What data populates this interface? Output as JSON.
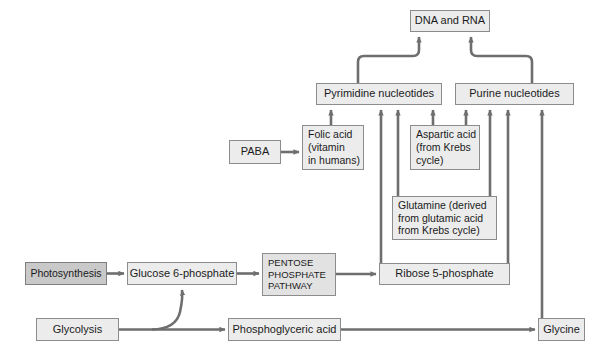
{
  "diagram": {
    "type": "flowchart",
    "colors": {
      "box_fill": "#ececec",
      "box_fill_highlight": "#c9c9c9",
      "box_border": "#8c8c8c",
      "arrow": "#6e6e6e",
      "text": "#1b1b1b",
      "background": "#ffffff"
    },
    "nodes": [
      {
        "id": "dna_rna",
        "label": "DNA and RNA",
        "x": 410,
        "y": 10,
        "w": 80,
        "h": 22,
        "style": "normal"
      },
      {
        "id": "pyrimidine",
        "label": "Pyrimidine nucleotides",
        "x": 316,
        "y": 83,
        "w": 126,
        "h": 22,
        "style": "normal"
      },
      {
        "id": "purine",
        "label": "Purine nucleotides",
        "x": 455,
        "y": 83,
        "w": 119,
        "h": 22,
        "style": "normal"
      },
      {
        "id": "paba",
        "label": "PABA",
        "x": 229,
        "y": 140,
        "w": 52,
        "h": 24,
        "style": "normal"
      },
      {
        "id": "folic_acid",
        "label": "Folic acid\n(vitamin\nin humans)",
        "x": 302,
        "y": 125,
        "w": 62,
        "h": 45,
        "style": "left"
      },
      {
        "id": "aspartic_acid",
        "label": "Aspartic acid\n(from Krebs\ncycle)",
        "x": 410,
        "y": 125,
        "w": 70,
        "h": 45,
        "style": "left"
      },
      {
        "id": "glutamine",
        "label": "Glutamine (derived\nfrom glutamic acid\nfrom Krebs cycle)",
        "x": 392,
        "y": 196,
        "w": 105,
        "h": 44,
        "style": "left"
      },
      {
        "id": "photosynthesis",
        "label": "Photosynthesis",
        "x": 25,
        "y": 262,
        "w": 82,
        "h": 23,
        "style": "dark"
      },
      {
        "id": "glucose6p",
        "label": "Glucose 6-phosphate",
        "x": 127,
        "y": 262,
        "w": 110,
        "h": 23,
        "style": "normal"
      },
      {
        "id": "ppp",
        "label": "PENTOSE\nPHOSPHATE\nPATHWAY",
        "x": 262,
        "y": 253,
        "w": 74,
        "h": 43,
        "style": "left"
      },
      {
        "id": "ribose5p",
        "label": "Ribose 5-phosphate",
        "x": 379,
        "y": 263,
        "w": 131,
        "h": 22,
        "style": "normal"
      },
      {
        "id": "glycolysis",
        "label": "Glycolysis",
        "x": 36,
        "y": 318,
        "w": 83,
        "h": 23,
        "style": "normal"
      },
      {
        "id": "pga",
        "label": "Phosphoglyceric acid",
        "x": 228,
        "y": 318,
        "w": 113,
        "h": 23,
        "style": "normal"
      },
      {
        "id": "glycine",
        "label": "Glycine",
        "x": 538,
        "y": 318,
        "w": 47,
        "h": 23,
        "style": "normal"
      }
    ],
    "edges": [
      {
        "from": "pyrimidine",
        "to": "dna_rna",
        "kind": "curve-right-up"
      },
      {
        "from": "purine",
        "to": "dna_rna",
        "kind": "curve-left-up"
      },
      {
        "from": "folic_acid",
        "to": "pyrimidine",
        "kind": "up"
      },
      {
        "from": "ribose5p",
        "to": "pyrimidine",
        "kind": "up-long"
      },
      {
        "from": "glutamine",
        "to": "pyrimidine",
        "kind": "up"
      },
      {
        "from": "aspartic_acid",
        "to": "pyrimidine",
        "kind": "up"
      },
      {
        "from": "aspartic_acid",
        "to": "purine",
        "kind": "up"
      },
      {
        "from": "glutamine",
        "to": "purine",
        "kind": "up"
      },
      {
        "from": "ribose5p",
        "to": "purine",
        "kind": "up-long"
      },
      {
        "from": "glycine",
        "to": "purine",
        "kind": "up-long"
      },
      {
        "from": "paba",
        "to": "folic_acid",
        "kind": "right"
      },
      {
        "from": "photosynthesis",
        "to": "glucose6p",
        "kind": "right"
      },
      {
        "from": "glucose6p",
        "to": "ppp",
        "kind": "right"
      },
      {
        "from": "ppp",
        "to": "ribose5p",
        "kind": "right"
      },
      {
        "from": "glycolysis",
        "to": "pga",
        "kind": "right-long"
      },
      {
        "from": "glycolysis",
        "to": "glucose6p",
        "kind": "curve-up"
      },
      {
        "from": "pga",
        "to": "glycine",
        "kind": "right-long"
      }
    ]
  }
}
